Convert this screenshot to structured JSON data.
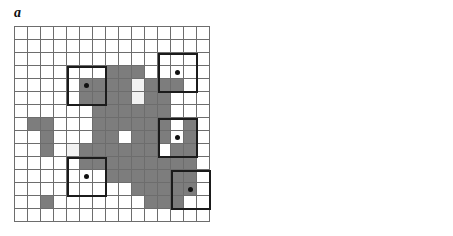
{
  "figure": {
    "width": 453,
    "height": 236,
    "background": "#ffffff",
    "grid_rows": 15,
    "grid_cols": 15,
    "cell_px": 13,
    "colors": {
      "gray_cell": "#7d7d7d",
      "light_cell": "#f2f2f2",
      "white_cell": "#ffffff",
      "thin_grid_line": "#6d6d6d",
      "thick_outline": "#1b1b1b",
      "dot": "#111111",
      "x_mark": "#1a1a1a"
    }
  },
  "panels": [
    {
      "id": "a",
      "label": "a",
      "origin": {
        "x": 14,
        "y": 26
      },
      "description": "15 by 15 raster grid with an irregular gray patch, white holes, sample dots and heavy outlined 3x3 neighbourhood boxes",
      "gray_cells": [
        [
          3,
          7
        ],
        [
          3,
          8
        ],
        [
          3,
          9
        ],
        [
          4,
          5
        ],
        [
          4,
          6
        ],
        [
          4,
          7
        ],
        [
          4,
          8
        ],
        [
          4,
          10
        ],
        [
          4,
          11
        ],
        [
          4,
          12
        ],
        [
          5,
          5
        ],
        [
          5,
          6
        ],
        [
          5,
          7
        ],
        [
          5,
          8
        ],
        [
          5,
          10
        ],
        [
          5,
          11
        ],
        [
          6,
          6
        ],
        [
          6,
          7
        ],
        [
          6,
          8
        ],
        [
          6,
          9
        ],
        [
          6,
          10
        ],
        [
          6,
          11
        ],
        [
          7,
          1
        ],
        [
          7,
          2
        ],
        [
          7,
          6
        ],
        [
          7,
          7
        ],
        [
          7,
          8
        ],
        [
          7,
          9
        ],
        [
          7,
          10
        ],
        [
          7,
          11
        ],
        [
          7,
          13
        ],
        [
          8,
          2
        ],
        [
          8,
          6
        ],
        [
          8,
          7
        ],
        [
          8,
          9
        ],
        [
          8,
          10
        ],
        [
          8,
          11
        ],
        [
          8,
          13
        ],
        [
          9,
          2
        ],
        [
          9,
          5
        ],
        [
          9,
          6
        ],
        [
          9,
          7
        ],
        [
          9,
          8
        ],
        [
          9,
          9
        ],
        [
          9,
          10
        ],
        [
          9,
          12
        ],
        [
          9,
          13
        ],
        [
          10,
          5
        ],
        [
          10,
          6
        ],
        [
          10,
          7
        ],
        [
          10,
          8
        ],
        [
          10,
          9
        ],
        [
          10,
          10
        ],
        [
          10,
          11
        ],
        [
          10,
          12
        ],
        [
          10,
          13
        ],
        [
          11,
          7
        ],
        [
          11,
          8
        ],
        [
          11,
          9
        ],
        [
          11,
          10
        ],
        [
          11,
          11
        ],
        [
          11,
          12
        ],
        [
          11,
          13
        ],
        [
          12,
          9
        ],
        [
          12,
          10
        ],
        [
          12,
          11
        ],
        [
          12,
          12
        ],
        [
          12,
          13
        ],
        [
          13,
          2
        ],
        [
          13,
          10
        ],
        [
          13,
          11
        ],
        [
          13,
          12
        ]
      ],
      "light_cells": [
        [
          4,
          9
        ],
        [
          5,
          9
        ],
        [
          9,
          4
        ]
      ],
      "dot_cells": [
        [
          4,
          5
        ],
        [
          3,
          12
        ],
        [
          8,
          12
        ],
        [
          11,
          5
        ],
        [
          12,
          13
        ]
      ],
      "thick_boxes": [
        {
          "row": 3,
          "col": 4,
          "rows": 3,
          "cols": 3
        },
        {
          "row": 2,
          "col": 11,
          "rows": 3,
          "cols": 3
        },
        {
          "row": 7,
          "col": 11,
          "rows": 3,
          "cols": 3
        },
        {
          "row": 10,
          "col": 4,
          "rows": 3,
          "cols": 3
        },
        {
          "row": 11,
          "col": 12,
          "rows": 3,
          "cols": 3
        }
      ]
    },
    {
      "id": "b",
      "label": "b",
      "origin": {
        "x": 237,
        "y": 26
      },
      "description": "15 by 15 raster grid showing the same patch after classification, gray interior with X marks on boundary pixels and sample dots",
      "gray_cells": [
        [
          3,
          5
        ],
        [
          3,
          6
        ],
        [
          3,
          7
        ],
        [
          3,
          8
        ],
        [
          3,
          9
        ],
        [
          4,
          4
        ],
        [
          4,
          5
        ],
        [
          4,
          6
        ],
        [
          4,
          7
        ],
        [
          4,
          8
        ],
        [
          4,
          9
        ],
        [
          4,
          10
        ],
        [
          4,
          11
        ],
        [
          4,
          12
        ],
        [
          5,
          3
        ],
        [
          5,
          4
        ],
        [
          5,
          5
        ],
        [
          5,
          6
        ],
        [
          5,
          7
        ],
        [
          5,
          8
        ],
        [
          5,
          9
        ],
        [
          5,
          10
        ],
        [
          5,
          11
        ],
        [
          5,
          12
        ],
        [
          6,
          3
        ],
        [
          6,
          4
        ],
        [
          6,
          5
        ],
        [
          6,
          6
        ],
        [
          6,
          7
        ],
        [
          6,
          8
        ],
        [
          6,
          9
        ],
        [
          6,
          10
        ],
        [
          6,
          11
        ],
        [
          6,
          12
        ],
        [
          7,
          0
        ],
        [
          7,
          1
        ],
        [
          7,
          2
        ],
        [
          7,
          3
        ],
        [
          7,
          4
        ],
        [
          7,
          5
        ],
        [
          7,
          6
        ],
        [
          7,
          7
        ],
        [
          7,
          8
        ],
        [
          7,
          9
        ],
        [
          7,
          10
        ],
        [
          7,
          11
        ],
        [
          8,
          0
        ],
        [
          8,
          1
        ],
        [
          8,
          2
        ],
        [
          8,
          3
        ],
        [
          8,
          4
        ],
        [
          8,
          5
        ],
        [
          8,
          6
        ],
        [
          8,
          7
        ],
        [
          8,
          8
        ],
        [
          8,
          9
        ],
        [
          8,
          10
        ],
        [
          9,
          0
        ],
        [
          9,
          1
        ],
        [
          9,
          2
        ],
        [
          9,
          3
        ],
        [
          9,
          4
        ],
        [
          9,
          5
        ],
        [
          9,
          6
        ],
        [
          9,
          7
        ],
        [
          9,
          8
        ],
        [
          9,
          9
        ],
        [
          9,
          10
        ],
        [
          9,
          11
        ],
        [
          9,
          12
        ],
        [
          10,
          1
        ],
        [
          10,
          2
        ],
        [
          10,
          3
        ],
        [
          10,
          4
        ],
        [
          10,
          5
        ],
        [
          10,
          6
        ],
        [
          10,
          7
        ],
        [
          10,
          8
        ],
        [
          10,
          9
        ],
        [
          10,
          10
        ],
        [
          10,
          12
        ],
        [
          11,
          1
        ],
        [
          11,
          2
        ],
        [
          11,
          3
        ],
        [
          11,
          4
        ],
        [
          11,
          5
        ],
        [
          11,
          6
        ],
        [
          11,
          7
        ],
        [
          11,
          8
        ],
        [
          11,
          9
        ],
        [
          11,
          10
        ],
        [
          11,
          12
        ],
        [
          12,
          4
        ],
        [
          12,
          5
        ],
        [
          12,
          6
        ],
        [
          12,
          7
        ],
        [
          12,
          8
        ],
        [
          12,
          9
        ],
        [
          12,
          10
        ],
        [
          12,
          11
        ],
        [
          12,
          12
        ],
        [
          13,
          6
        ],
        [
          13,
          7
        ],
        [
          13,
          8
        ],
        [
          13,
          9
        ],
        [
          13,
          10
        ],
        [
          13,
          11
        ],
        [
          13,
          12
        ],
        [
          14,
          1
        ],
        [
          14,
          2
        ],
        [
          14,
          3
        ],
        [
          14,
          9
        ],
        [
          14,
          10
        ],
        [
          14,
          11
        ],
        [
          14,
          12
        ],
        [
          14,
          13
        ],
        [
          15,
          1
        ],
        [
          15,
          2
        ],
        [
          15,
          3
        ],
        [
          15,
          9
        ],
        [
          15,
          10
        ],
        [
          15,
          11
        ],
        [
          15,
          12
        ],
        [
          15,
          13
        ],
        [
          16,
          1
        ],
        [
          16,
          2
        ],
        [
          16,
          3
        ]
      ],
      "x_cells": [
        [
          3,
          5
        ],
        [
          3,
          6
        ],
        [
          3,
          7
        ],
        [
          3,
          8
        ],
        [
          3,
          9
        ],
        [
          4,
          4
        ],
        [
          4,
          5
        ],
        [
          4,
          6
        ],
        [
          4,
          10
        ],
        [
          4,
          11
        ],
        [
          4,
          12
        ],
        [
          5,
          3
        ],
        [
          5,
          4
        ],
        [
          5,
          8
        ],
        [
          5,
          12
        ],
        [
          6,
          3
        ],
        [
          6,
          8
        ],
        [
          6,
          11
        ],
        [
          6,
          12
        ],
        [
          7,
          0
        ],
        [
          7,
          1
        ],
        [
          7,
          2
        ],
        [
          7,
          3
        ],
        [
          7,
          10
        ],
        [
          7,
          11
        ],
        [
          8,
          0
        ],
        [
          8,
          3
        ],
        [
          8,
          10
        ],
        [
          9,
          0
        ],
        [
          9,
          1
        ],
        [
          9,
          3
        ],
        [
          9,
          6
        ],
        [
          9,
          10
        ],
        [
          9,
          11
        ],
        [
          9,
          12
        ],
        [
          10,
          1
        ],
        [
          10,
          3
        ],
        [
          10,
          4
        ],
        [
          10,
          10
        ],
        [
          10,
          12
        ],
        [
          11,
          1
        ],
        [
          11,
          2
        ],
        [
          11,
          3
        ],
        [
          11,
          4
        ],
        [
          11,
          12
        ],
        [
          12,
          4
        ],
        [
          12,
          5
        ],
        [
          12,
          6
        ],
        [
          12,
          12
        ],
        [
          13,
          7
        ],
        [
          13,
          8
        ],
        [
          13,
          9
        ],
        [
          13,
          12
        ],
        [
          14,
          1
        ],
        [
          14,
          2
        ],
        [
          14,
          3
        ],
        [
          14,
          9
        ],
        [
          14,
          12
        ],
        [
          15,
          1
        ],
        [
          15,
          3
        ],
        [
          15,
          9
        ],
        [
          15,
          10
        ],
        [
          15,
          11
        ],
        [
          15,
          12
        ],
        [
          15,
          13
        ],
        [
          16,
          1
        ],
        [
          16,
          2
        ],
        [
          16,
          3
        ]
      ],
      "dot_cells": [
        [
          4,
          12
        ],
        [
          5,
          4
        ],
        [
          9,
          10
        ],
        [
          13,
          6
        ],
        [
          14,
          12
        ]
      ],
      "x_glyph": "×"
    }
  ]
}
